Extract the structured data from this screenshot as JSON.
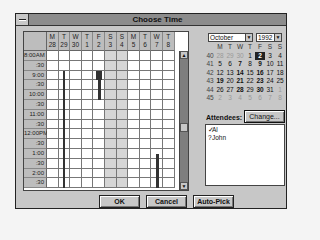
{
  "window": {
    "title": "Choose Time"
  },
  "grid": {
    "days": [
      {
        "dow": "M",
        "date": "28",
        "weekend": false
      },
      {
        "dow": "T",
        "date": "29",
        "weekend": false
      },
      {
        "dow": "W",
        "date": "30",
        "weekend": false
      },
      {
        "dow": "T",
        "date": "1",
        "weekend": false
      },
      {
        "dow": "F",
        "date": "2",
        "weekend": false
      },
      {
        "dow": "S",
        "date": "3",
        "weekend": true
      },
      {
        "dow": "S",
        "date": "4",
        "weekend": true
      },
      {
        "dow": "M",
        "date": "5",
        "weekend": false
      },
      {
        "dow": "T",
        "date": "6",
        "weekend": false
      },
      {
        "dow": "W",
        "date": "7",
        "weekend": false
      },
      {
        "dow": "T",
        "date": "8",
        "weekend": false
      }
    ],
    "times": [
      "8:00AM",
      ":30",
      "9:00",
      ":30",
      "10:00",
      ":30",
      "11:00",
      ":30",
      "12:00PM",
      ":30",
      "1:00",
      ":30",
      "2:00",
      ":30"
    ],
    "busy": [
      {
        "day": 1,
        "start": 2,
        "end": 14,
        "width": 2
      },
      {
        "day": 4,
        "start": 2,
        "end": 3,
        "width": 6
      },
      {
        "day": 4,
        "start": 3,
        "end": 5,
        "width": 3
      },
      {
        "day": 9,
        "start": 10.5,
        "end": 14,
        "width": 3
      }
    ]
  },
  "calendar": {
    "month": "October",
    "year": "1992",
    "headers": [
      "",
      "M",
      "T",
      "W",
      "T",
      "F",
      "S",
      "S"
    ],
    "weeks": [
      {
        "wk": "40",
        "days": [
          {
            "d": "28",
            "s": "dim"
          },
          {
            "d": "29",
            "s": "dim"
          },
          {
            "d": "30",
            "s": "dim"
          },
          {
            "d": "1",
            "s": ""
          },
          {
            "d": "2",
            "s": "sel"
          },
          {
            "d": "3",
            "s": ""
          },
          {
            "d": "4",
            "s": ""
          }
        ]
      },
      {
        "wk": "41",
        "days": [
          {
            "d": "5",
            "s": ""
          },
          {
            "d": "6",
            "s": ""
          },
          {
            "d": "7",
            "s": "bold"
          },
          {
            "d": "8",
            "s": ""
          },
          {
            "d": "9",
            "s": "bold"
          },
          {
            "d": "10",
            "s": ""
          },
          {
            "d": "11",
            "s": ""
          }
        ]
      },
      {
        "wk": "42",
        "days": [
          {
            "d": "12",
            "s": ""
          },
          {
            "d": "13",
            "s": ""
          },
          {
            "d": "14",
            "s": "bold"
          },
          {
            "d": "15",
            "s": ""
          },
          {
            "d": "16",
            "s": "bold"
          },
          {
            "d": "17",
            "s": ""
          },
          {
            "d": "18",
            "s": ""
          }
        ]
      },
      {
        "wk": "43",
        "days": [
          {
            "d": "19",
            "s": "bold"
          },
          {
            "d": "20",
            "s": ""
          },
          {
            "d": "21",
            "s": "bold"
          },
          {
            "d": "22",
            "s": ""
          },
          {
            "d": "23",
            "s": "bold"
          },
          {
            "d": "24",
            "s": ""
          },
          {
            "d": "25",
            "s": ""
          }
        ]
      },
      {
        "wk": "44",
        "days": [
          {
            "d": "26",
            "s": ""
          },
          {
            "d": "27",
            "s": ""
          },
          {
            "d": "28",
            "s": "bold"
          },
          {
            "d": "29",
            "s": ""
          },
          {
            "d": "30",
            "s": "bold"
          },
          {
            "d": "31",
            "s": ""
          },
          {
            "d": "1",
            "s": "dim"
          }
        ]
      },
      {
        "wk": "45",
        "days": [
          {
            "d": "2",
            "s": "dim"
          },
          {
            "d": "3",
            "s": "dim"
          },
          {
            "d": "4",
            "s": "dim"
          },
          {
            "d": "5",
            "s": "dim"
          },
          {
            "d": "6",
            "s": "dim"
          },
          {
            "d": "7",
            "s": "dim"
          },
          {
            "d": "8",
            "s": "dim"
          }
        ]
      }
    ]
  },
  "attendees": {
    "label": "Attendees:",
    "change_label": "Change...",
    "items": [
      {
        "mark": "✓",
        "name": "Al"
      },
      {
        "mark": "?",
        "name": "John"
      }
    ]
  },
  "buttons": {
    "ok": "OK",
    "cancel": "Cancel",
    "autopick": "Auto-Pick"
  },
  "scroll": {
    "up": "▲",
    "down": "▼"
  },
  "dropdown_arrow": "▼"
}
